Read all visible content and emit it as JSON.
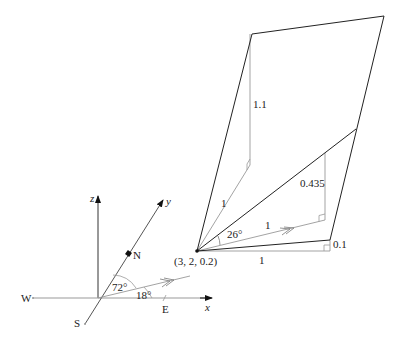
{
  "axes": {
    "x_label": "x",
    "y_label": "y",
    "z_label": "z",
    "compass": {
      "north": "N",
      "south": "S",
      "east": "E",
      "west": "W"
    },
    "angle_from_y": "72°",
    "angle_from_x": "18°"
  },
  "point": {
    "label": "(3, 2, 0.2)"
  },
  "measurements": {
    "vertical_top": "1.1",
    "upper_slant": "1",
    "angle_26": "26°",
    "direction_length": "1",
    "rise_mid": "0.435",
    "horizontal_length": "1",
    "rise_bottom": "0.1"
  },
  "colors": {
    "line": "#222222",
    "aux": "#9a9a9a"
  }
}
